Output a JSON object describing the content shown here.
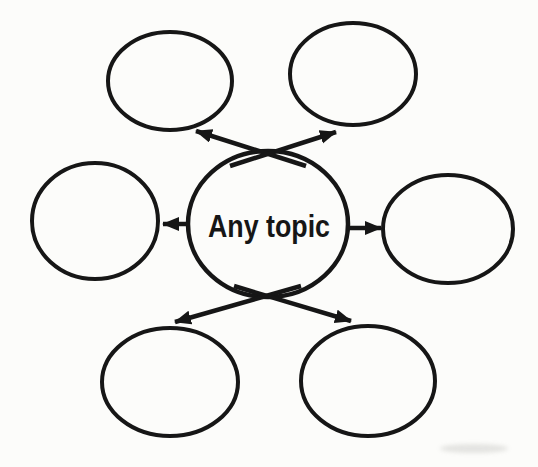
{
  "diagram": {
    "type": "spider-map",
    "center_label": "Any topic",
    "ink_color": "#161616",
    "background_color": "#fcfcfa",
    "node_count": 6,
    "nodes": [
      {
        "id": "top-left",
        "label": ""
      },
      {
        "id": "top-right",
        "label": ""
      },
      {
        "id": "left",
        "label": ""
      },
      {
        "id": "right",
        "label": ""
      },
      {
        "id": "bottom-left",
        "label": ""
      },
      {
        "id": "bottom-right",
        "label": ""
      }
    ],
    "connections": [
      {
        "from": "center",
        "to": "top-left"
      },
      {
        "from": "center",
        "to": "top-right"
      },
      {
        "from": "center",
        "to": "left"
      },
      {
        "from": "center",
        "to": "right"
      },
      {
        "from": "center",
        "to": "bottom-left"
      },
      {
        "from": "center",
        "to": "bottom-right"
      }
    ]
  }
}
